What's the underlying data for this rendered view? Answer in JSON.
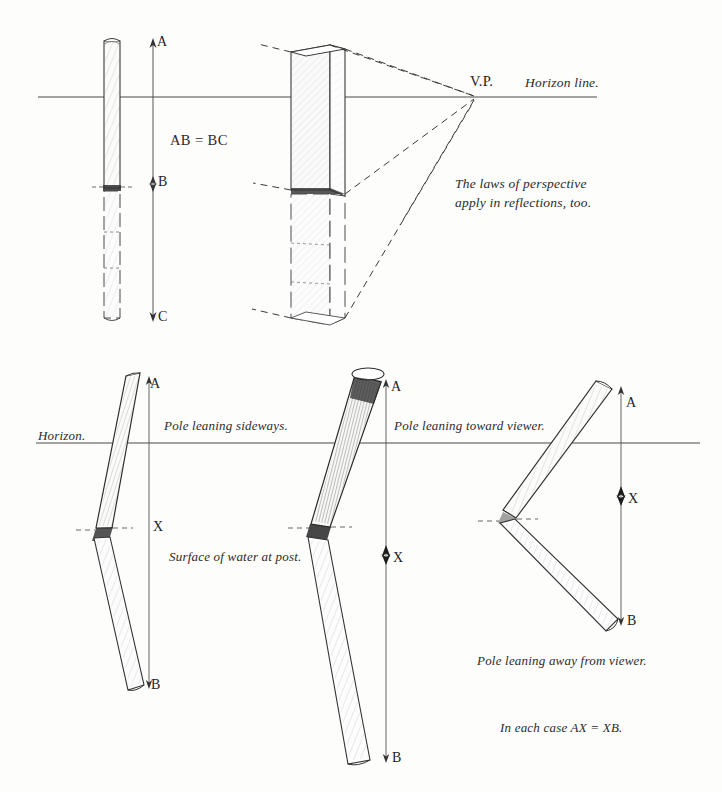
{
  "page": {
    "background_color": "#fdfdfc",
    "ink_color": "#2b2b2b"
  },
  "top_panel": {
    "name": "reflection-perspective-panel",
    "horizon_label": "Horizon line.",
    "vanishing_point_label": "V.P.",
    "equality_label": "AB = BC",
    "note_line1": "The laws of perspective",
    "note_line2": "apply in reflections, too.",
    "flat_pole": {
      "name": "flat-vertical-post",
      "markers": [
        "A",
        "B",
        "C"
      ],
      "top_label": "A",
      "waterline_label": "B",
      "bottom_label": "C"
    },
    "perspective_post": {
      "name": "perspective-box-post",
      "description": "rectangular post in perspective with dashed convergence lines to V.P."
    }
  },
  "bottom_panel": {
    "name": "leaning-poles-panel",
    "horizon_label": "Horizon.",
    "water_surface_label": "Surface of water at post.",
    "conclusion_label": "In each case AX = XB.",
    "poles": [
      {
        "name": "pole-leaning-sideways",
        "caption": "Pole leaning sideways.",
        "top_label": "A",
        "mid_label": "X",
        "bottom_label": "B"
      },
      {
        "name": "pole-leaning-toward-viewer",
        "caption": "Pole leaning toward viewer.",
        "top_label": "A",
        "mid_label": "X",
        "bottom_label": "B"
      },
      {
        "name": "pole-leaning-away-from-viewer",
        "caption": "Pole leaning away from viewer.",
        "top_label": "A",
        "mid_label": "X",
        "bottom_label": "B"
      }
    ]
  }
}
